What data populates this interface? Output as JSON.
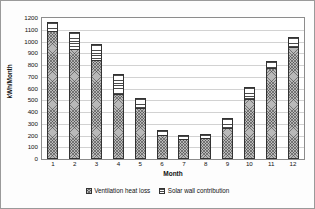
{
  "chart_data": {
    "type": "bar",
    "stacked": true,
    "title": "",
    "xlabel": "Month",
    "ylabel": "kWh/Month",
    "categories": [
      "1",
      "2",
      "3",
      "4",
      "5",
      "6",
      "7",
      "8",
      "9",
      "10",
      "11",
      "12"
    ],
    "ylim": [
      0,
      1200
    ],
    "ytick_step": 100,
    "yticks": [
      "1200",
      "1100",
      "1000",
      "900",
      "800",
      "700",
      "600",
      "500",
      "400",
      "300",
      "200",
      "100",
      "0"
    ],
    "grid": true,
    "grid_axis": "y",
    "legend_position": "bottom",
    "series": [
      {
        "name": "Ventilation heat loss",
        "fill": "cross-hatch-grey",
        "values": [
          1070,
          920,
          825,
          535,
          415,
          185,
          155,
          165,
          245,
          490,
          760,
          935
        ]
      },
      {
        "name": "Solar wall contribution",
        "fill": "horizontal-stripes",
        "values": [
          80,
          140,
          135,
          175,
          90,
          45,
          30,
          35,
          90,
          110,
          60,
          85
        ]
      }
    ],
    "totals": [
      1150,
      1060,
      960,
      710,
      505,
      230,
      185,
      200,
      335,
      600,
      820,
      1020
    ]
  },
  "legend": {
    "items": [
      {
        "label": "Ventilation heat loss",
        "swatch": "cross-hatch-swatch"
      },
      {
        "label": "Solar wall contribution",
        "swatch": "striped-swatch"
      }
    ]
  },
  "colors": {
    "frame": "#8c8c8c",
    "gridline": "#d2d2d2",
    "bar_outline": "#333333",
    "vent_fill": "#b9b9b9",
    "solar_fill": "#ffffff",
    "text": "#111111",
    "background": "#ffffff"
  }
}
